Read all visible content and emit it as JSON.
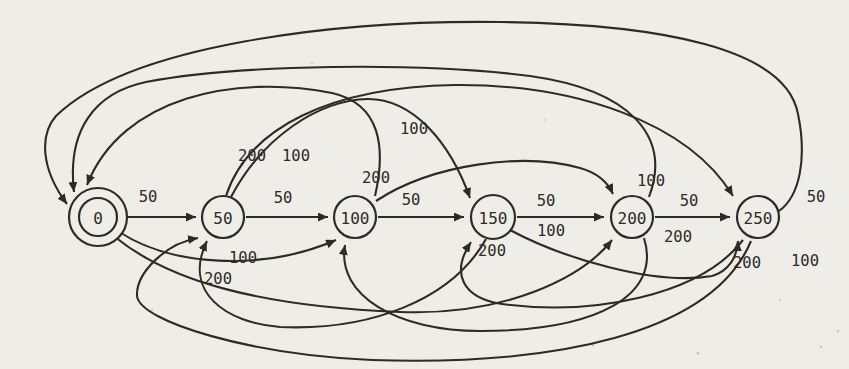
{
  "figure": {
    "kind": "finite-state-diagram",
    "canvas": {
      "width": 849,
      "height": 369
    },
    "background_color": "#efede8",
    "ink_color": "#2d2b27",
    "speck_color": "#c8c5bb",
    "node_font_size": 16,
    "label_font_size": 15.5,
    "stroke_width": 2.1
  },
  "states": [
    {
      "id": "0",
      "label": "0",
      "x": 98,
      "y": 217,
      "r": 29,
      "double": true,
      "inner_r": 19
    },
    {
      "id": "50",
      "label": "50",
      "x": 223,
      "y": 217,
      "r": 21,
      "double": false,
      "inner_r": 0
    },
    {
      "id": "100",
      "label": "100",
      "x": 355,
      "y": 217,
      "r": 21,
      "double": false,
      "inner_r": 0
    },
    {
      "id": "150",
      "label": "150",
      "x": 493,
      "y": 217,
      "r": 22,
      "double": false,
      "inner_r": 0
    },
    {
      "id": "200",
      "label": "200",
      "x": 632,
      "y": 217,
      "r": 21,
      "double": false,
      "inner_r": 0
    },
    {
      "id": "250",
      "label": "250",
      "x": 758,
      "y": 217,
      "r": 21,
      "double": false,
      "inner_r": 0
    }
  ],
  "transitions": [
    {
      "from": "0",
      "to": "50",
      "label": "50",
      "label_x": 148,
      "label_y": 197,
      "path": "M 128 217 L 196 217"
    },
    {
      "from": "50",
      "to": "100",
      "label": "50",
      "label_x": 283,
      "label_y": 198,
      "path": "M 246 217 L 328 217"
    },
    {
      "from": "100",
      "to": "150",
      "label": "50",
      "label_x": 411,
      "label_y": 200,
      "path": "M 378 217 L 464 217"
    },
    {
      "from": "150",
      "to": "200",
      "label": "50",
      "label_x": 546,
      "label_y": 201,
      "path": "M 517 217 L 604 217"
    },
    {
      "from": "200",
      "to": "250",
      "label": "50",
      "label_x": 689,
      "label_y": 201,
      "path": "M 655 217 L 730 217"
    },
    {
      "from": "0",
      "to": "100",
      "label": "100",
      "label_x": 243,
      "label_y": 258,
      "path": "M 118 231 C 170 266, 262 272, 336 240"
    },
    {
      "from": "0",
      "to": "200",
      "label": "200",
      "label_x": 218,
      "label_y": 279,
      "path": "M 115 237 C 168 280, 255 306, 400 312 C 505 316, 582 278, 612 240"
    },
    {
      "from": "50",
      "to": "150",
      "label": "100",
      "label_x": 296,
      "label_y": 156,
      "path": "M 231 197 C 262 138, 318 100, 368 99 C 413 99, 450 142, 470 198"
    },
    {
      "from": "50",
      "to": "250",
      "label": "200",
      "label_x": 252,
      "label_y": 156,
      "path": "M 226 196 C 248 128, 330 87, 455 85 C 575 84, 688 122, 733 196"
    },
    {
      "from": "100",
      "to": "0",
      "label": "200",
      "label_x": 376,
      "label_y": 178,
      "path": "M 375 196 C 386 148, 381 104, 332 93 C 237 74, 122 96, 87 185"
    },
    {
      "from": "200",
      "to": "0",
      "label": "100",
      "label_x": 414,
      "label_y": 129,
      "path": "M 649 197 C 672 136, 630 90, 530 76 C 420 62, 240 64, 146 82 C 93 93, 67 132, 74 192"
    },
    {
      "from": "250",
      "to": "0",
      "label": "50",
      "label_x": 816,
      "label_y": 197,
      "path": "M 779 211 C 800 196, 807 158, 798 114 C 786 48, 660 24, 500 22 C 340 20, 130 44, 56 116 C 40 134, 40 168, 67 204"
    },
    {
      "from": "100",
      "to": "200",
      "label": "100",
      "label_x": 651,
      "label_y": 181,
      "path": "M 376 201 C 432 164, 523 152, 580 168 C 598 173, 608 183, 613 194"
    },
    {
      "from": "150",
      "to": "250",
      "label": "100",
      "label_x": 551,
      "label_y": 231,
      "path": "M 510 230 C 562 258, 655 286, 712 276 C 729 271, 737 257, 738 241"
    },
    {
      "from": "150",
      "to": "50",
      "label": "200",
      "label_x": 492,
      "label_y": 251,
      "path": "M 486 239 C 452 300, 370 331, 280 327 C 226 323, 182 292, 207 241"
    },
    {
      "from": "200",
      "to": "100",
      "label": "200",
      "label_x": 678,
      "label_y": 237,
      "path": "M 644 238 C 662 295, 598 331, 480 331 C 398 331, 336 296, 345 245"
    },
    {
      "from": "250",
      "to": "50",
      "label": "100",
      "label_x": 805,
      "label_y": 261,
      "path": "M 751 241 C 712 335, 552 366, 372 360 C 252 355, 140 322, 137 296 C 136 272, 167 243, 198 238"
    },
    {
      "from": "250",
      "to": "150",
      "label": "200",
      "label_x": 747,
      "label_y": 263,
      "path": "M 743 240 C 700 296, 592 316, 502 304 C 463 298, 450 274, 471 242"
    }
  ],
  "paper_specks": [
    {
      "x": 593,
      "y": 345,
      "r": 1.4
    },
    {
      "x": 821,
      "y": 347,
      "r": 1.2
    },
    {
      "x": 698,
      "y": 353,
      "r": 1.6
    },
    {
      "x": 838,
      "y": 331,
      "r": 1.3
    },
    {
      "x": 312,
      "y": 63,
      "r": 1.0
    },
    {
      "x": 152,
      "y": 310,
      "r": 1.1
    },
    {
      "x": 545,
      "y": 120,
      "r": 0.9
    },
    {
      "x": 780,
      "y": 300,
      "r": 1.0
    }
  ]
}
